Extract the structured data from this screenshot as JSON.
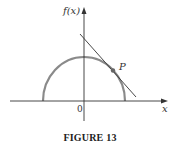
{
  "figure": {
    "caption": "FIGURE 13",
    "y_axis_label": "f(x)",
    "x_axis_label": "x",
    "origin_label": "0",
    "point_label": "P",
    "colors": {
      "curve": "#8a8a8a",
      "axes": "#333333",
      "tangent": "#333333",
      "point": "#666666"
    },
    "elements": {
      "curve": "upper semicircle centered at origin",
      "tangent_line": "tangent to semicircle at point P",
      "point": "P"
    }
  }
}
